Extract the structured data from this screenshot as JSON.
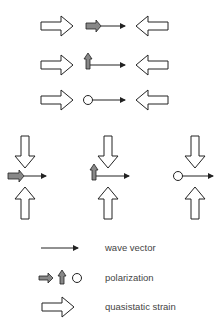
{
  "diagram": {
    "rows": [
      {
        "id": "row-1",
        "polarization": "longitudinal",
        "strain_direction": "horizontal-compressive"
      },
      {
        "id": "row-2",
        "polarization": "transverse-in-plane",
        "strain_direction": "horizontal-compressive"
      },
      {
        "id": "row-3",
        "polarization": "transverse-out-of-plane",
        "strain_direction": "horizontal-compressive"
      }
    ],
    "columns": [
      {
        "id": "col-1",
        "polarization": "longitudinal",
        "strain_direction": "vertical-compressive"
      },
      {
        "id": "col-2",
        "polarization": "transverse-in-plane",
        "strain_direction": "vertical-compressive"
      },
      {
        "id": "col-3",
        "polarization": "transverse-out-of-plane",
        "strain_direction": "vertical-compressive"
      }
    ],
    "colors": {
      "outline": "#222222",
      "polarization_fill": "#888888",
      "background": "#ffffff"
    }
  },
  "legend": {
    "items": [
      {
        "symbol": "wave-vector-arrow",
        "label": "wave vector"
      },
      {
        "symbol": "polarization-symbols",
        "label": "polarization"
      },
      {
        "symbol": "strain-arrow",
        "label": "quasistatic strain"
      }
    ]
  }
}
